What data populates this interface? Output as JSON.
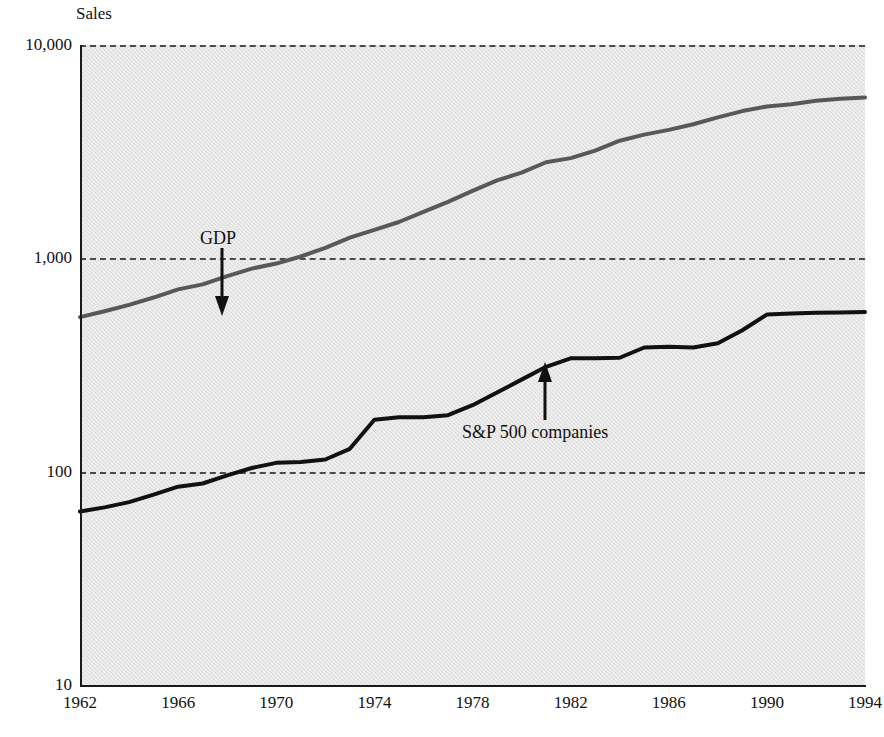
{
  "chart_data": {
    "type": "line",
    "title": "",
    "ylabel": "Sales",
    "xlabel": "",
    "yscale": "log",
    "ylim": [
      10,
      10000
    ],
    "xlim": [
      1962,
      1994
    ],
    "grid": true,
    "legend_position": "inline-annotations",
    "y_ticks": [
      {
        "value": 10,
        "label": "10"
      },
      {
        "value": 100,
        "label": "100"
      },
      {
        "value": 1000,
        "label": "1,000"
      },
      {
        "value": 10000,
        "label": "10,000"
      }
    ],
    "x_ticks": [
      {
        "value": 1962,
        "label": "1962"
      },
      {
        "value": 1966,
        "label": "1966"
      },
      {
        "value": 1970,
        "label": "1970"
      },
      {
        "value": 1974,
        "label": "1974"
      },
      {
        "value": 1978,
        "label": "1978"
      },
      {
        "value": 1982,
        "label": "1982"
      },
      {
        "value": 1986,
        "label": "1986"
      },
      {
        "value": 1990,
        "label": "1990"
      },
      {
        "value": 1994,
        "label": "1994"
      }
    ],
    "x": [
      1962,
      1963,
      1964,
      1965,
      1966,
      1967,
      1968,
      1969,
      1970,
      1971,
      1972,
      1973,
      1974,
      1975,
      1976,
      1977,
      1978,
      1979,
      1980,
      1981,
      1982,
      1983,
      1984,
      1985,
      1986,
      1987,
      1988,
      1989,
      1990,
      1991,
      1992,
      1993,
      1994
    ],
    "series": [
      {
        "name": "GDP",
        "color": "#585858",
        "values": [
          530,
          565,
          605,
          655,
          715,
          755,
          825,
          895,
          945,
          1020,
          1120,
          1250,
          1360,
          1480,
          1650,
          1840,
          2070,
          2320,
          2520,
          2820,
          2950,
          3200,
          3560,
          3800,
          4000,
          4250,
          4580,
          4900,
          5150,
          5280,
          5480,
          5600,
          5680
        ]
      },
      {
        "name": "S&P 500 companies",
        "color": "#111111",
        "values": [
          65,
          68,
          72,
          78,
          85,
          88,
          96,
          104,
          110,
          111,
          114,
          128,
          175,
          180,
          180,
          184,
          205,
          235,
          270,
          310,
          340,
          340,
          342,
          382,
          385,
          382,
          400,
          460,
          545,
          552,
          556,
          558,
          560
        ]
      }
    ],
    "annotations": [
      {
        "name": "GDP",
        "text": "GDP",
        "arrow_direction": "down",
        "points_to_series": "GDP",
        "points_to_x": 1968
      },
      {
        "name": "S&P 500 companies",
        "text": "S&P 500 companies",
        "arrow_direction": "up",
        "points_to_series": "S&P 500 companies",
        "points_to_x": 1981
      }
    ]
  },
  "axes": {
    "y_title": "Sales"
  },
  "colors": {
    "plot_background": "#e3e3e3",
    "axis": "#1a1a1a",
    "gridline": "#4a4a4a",
    "gdp_line": "#585858",
    "sp500_line": "#111111",
    "text": "#111111"
  }
}
